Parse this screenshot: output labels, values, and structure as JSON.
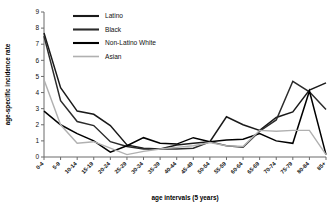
{
  "chart_data": {
    "type": "line",
    "title": "",
    "xlabel": "age intervals (5 years)",
    "ylabel": "age-specific incidence rate",
    "ylim": [
      0,
      9
    ],
    "yticks": [
      0,
      1,
      2,
      3,
      4,
      5,
      6,
      7,
      8,
      9
    ],
    "grid": false,
    "legend_position": "top-left-inside",
    "categories": [
      "0-4",
      "5-9",
      "10-14",
      "15-19",
      "20-24",
      "25-29",
      "30-34",
      "35-39",
      "40-44",
      "45-49",
      "50-54",
      "55-59",
      "60-64",
      "65-69",
      "70-74",
      "75-79",
      "80-84",
      "85+"
    ],
    "series": [
      {
        "name": "Latino",
        "color": "#1a1a1a",
        "width": 1.5,
        "values": [
          7.7,
          4.3,
          2.85,
          2.65,
          1.95,
          0.75,
          0.55,
          0.5,
          0.75,
          0.85,
          0.95,
          2.5,
          2.0,
          1.65,
          2.45,
          2.8,
          4.15,
          4.6
        ]
      },
      {
        "name": "Black",
        "color": "#2b2b2b",
        "width": 1.5,
        "values": [
          7.5,
          3.5,
          2.2,
          1.95,
          0.95,
          0.65,
          0.5,
          0.5,
          0.5,
          0.55,
          0.95,
          0.7,
          0.6,
          1.6,
          2.3,
          4.7,
          4.05,
          2.95
        ]
      },
      {
        "name": "Non-Latino White",
        "color": "#000000",
        "width": 1.5,
        "values": [
          2.85,
          2.0,
          1.45,
          1.0,
          0.3,
          0.7,
          1.2,
          0.85,
          0.8,
          1.2,
          0.95,
          1.05,
          1.1,
          1.45,
          1.0,
          0.85,
          4.1,
          0.15
        ]
      },
      {
        "name": "Asian",
        "color": "#b0b0b0",
        "width": 1.4,
        "values": [
          4.8,
          2.0,
          0.85,
          0.95,
          0.55,
          0.15,
          0.35,
          0.5,
          0.6,
          0.7,
          0.9,
          0.7,
          0.65,
          1.65,
          1.6,
          1.65,
          1.65,
          0.15
        ]
      }
    ]
  },
  "legend": {
    "items": [
      {
        "label": "Latino"
      },
      {
        "label": "Black"
      },
      {
        "label": "Non-Latino White"
      },
      {
        "label": "Asian"
      }
    ]
  },
  "axes": {
    "y_title": "age-specific incidence rate",
    "x_title": "age intervals (5 years)"
  }
}
